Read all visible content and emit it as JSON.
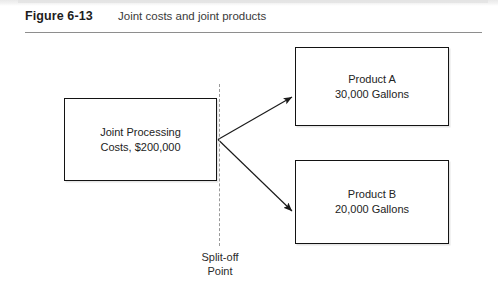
{
  "figure": {
    "label": "Figure 6-13",
    "caption": "Joint costs and joint products"
  },
  "diagram": {
    "type": "flow",
    "joint_process": {
      "line1": "Joint Processing",
      "line2": "Costs, $200,000"
    },
    "split_off": {
      "line1": "Split-off",
      "line2": "Point"
    },
    "outputs": [
      {
        "line1": "Product A",
        "line2": "30,000 Gallons"
      },
      {
        "line1": "Product B",
        "line2": "20,000 Gallons"
      }
    ]
  },
  "colors": {
    "box_border": "#131313",
    "rule": "#8e8e8e",
    "dashed_line": "#9a9a9a",
    "text": "#232323",
    "arrow": "#1a1a1a"
  }
}
